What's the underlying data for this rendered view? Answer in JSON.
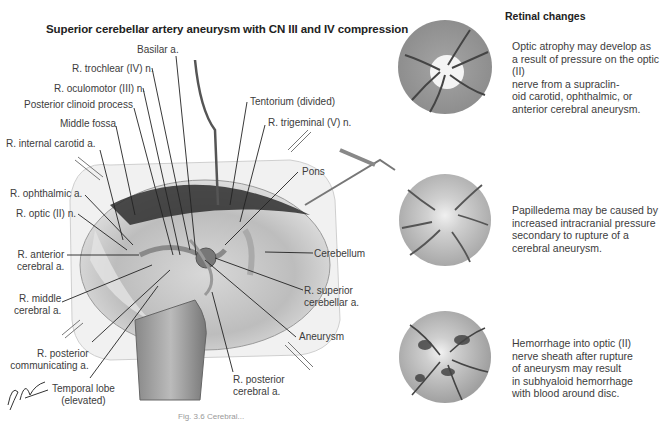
{
  "figure": {
    "title": "Superior cerebellar artery aneurysm with CN III and IV compression",
    "caption_partial": "Fig. 3.6 Cerebral...",
    "signature": "F. Netter M.D."
  },
  "labels": {
    "basilar": "Basilar a.",
    "trochlear": "R. trochlear (IV) n.",
    "oculomotor": "R. oculomotor (III) n.",
    "post_clinoid": "Posterior clinoid process",
    "middle_fossa": "Middle fossa",
    "int_carotid": "R. internal carotid a.",
    "tentorium": "Tentorium (divided)",
    "trigeminal": "R. trigeminal (V) n.",
    "pons": "Pons",
    "ophthalmic": "R. ophthalmic a.",
    "optic": "R. optic (II) n.",
    "ant_cerebral_1": "R. anterior",
    "ant_cerebral_2": "cerebral a.",
    "mid_cerebral_1": "R. middle",
    "mid_cerebral_2": "cerebral a.",
    "cerebellum": "Cerebellum",
    "sup_cerebellar_1": "R. superior",
    "sup_cerebellar_2": "cerebellar a.",
    "aneurysm": "Aneurysm",
    "post_comm_1": "R. posterior",
    "post_comm_2": "communicating a.",
    "temporal_1": "Temporal lobe",
    "temporal_2": "(elevated)",
    "post_cerebral_1": "R. posterior",
    "post_cerebral_2": "cerebral a."
  },
  "retinal": {
    "title": "Retinal changes",
    "panels": [
      {
        "name": "optic-atrophy",
        "text": "Optic atrophy may develop as\na result of pressure on the optic (II)\nnerve from a supraclin-\noid carotid, ophthalmic, or\nanterior cerebral aneurysm."
      },
      {
        "name": "papilledema",
        "text": "Papilledema may be caused by\nincreased intracranial pressure\nsecondary to rupture of a\ncerebral aneurysm."
      },
      {
        "name": "hemorrhage",
        "text": "Hemorrhage into optic (II)\nnerve sheath after rupture\nof aneurysm may result\nin subhyaloid hemorrhage\nwith blood around disc."
      }
    ]
  },
  "colors": {
    "fundus_gray": "#9a9a9a",
    "vessel": "#4a4a4a",
    "leader_line": "#222222"
  }
}
